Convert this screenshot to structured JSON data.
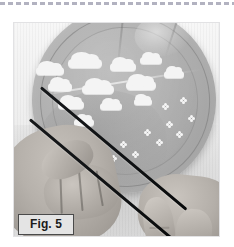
{
  "page": {
    "background_color": "#ffffff",
    "width": 234,
    "height": 247
  },
  "top_rule": {
    "style": "dashed",
    "color": "#b2b2c0",
    "dash_length_px": 5,
    "gap_length_px": 3
  },
  "figure": {
    "label": "Fig. 5",
    "label_background": "#e4e4e4",
    "label_border_color": "#4a4a4a",
    "label_text_color": "#1b1b1b",
    "frame_border_color": "#e2e2e4",
    "photo": {
      "type": "grayscale-photograph",
      "subject": "Two hands holding a decorated paper plate with two dark sticks laid diagonally across it",
      "plate_color": "#b0b0b0",
      "decoration_color": "#f4f4f4",
      "stick_color": "#101214",
      "skin_color": "#b4afa9",
      "backdrop_color": "#f1f1f1"
    }
  },
  "decorations": {
    "clouds": [
      {
        "left": 22,
        "top": 44,
        "width": 28,
        "height": 8
      },
      {
        "left": 54,
        "top": 36,
        "width": 34,
        "height": 9
      },
      {
        "left": 96,
        "top": 40,
        "width": 26,
        "height": 8
      },
      {
        "left": 126,
        "top": 34,
        "width": 22,
        "height": 7
      },
      {
        "left": 34,
        "top": 60,
        "width": 24,
        "height": 8
      },
      {
        "left": 68,
        "top": 62,
        "width": 32,
        "height": 9
      },
      {
        "left": 112,
        "top": 58,
        "width": 30,
        "height": 9
      },
      {
        "left": 150,
        "top": 48,
        "width": 20,
        "height": 7
      },
      {
        "left": 44,
        "top": 78,
        "width": 26,
        "height": 8
      },
      {
        "left": 86,
        "top": 80,
        "width": 22,
        "height": 7
      },
      {
        "left": 120,
        "top": 76,
        "width": 18,
        "height": 6
      },
      {
        "left": 60,
        "top": 96,
        "width": 20,
        "height": 7
      }
    ],
    "flowers": [
      {
        "left": 40,
        "top": 132
      },
      {
        "left": 52,
        "top": 142
      },
      {
        "left": 62,
        "top": 126
      },
      {
        "left": 74,
        "top": 138
      },
      {
        "left": 86,
        "top": 120
      },
      {
        "left": 96,
        "top": 132
      },
      {
        "left": 106,
        "top": 118
      },
      {
        "left": 118,
        "top": 128
      },
      {
        "left": 130,
        "top": 106
      },
      {
        "left": 142,
        "top": 116
      },
      {
        "left": 152,
        "top": 98
      },
      {
        "left": 162,
        "top": 108
      },
      {
        "left": 174,
        "top": 92
      },
      {
        "left": 148,
        "top": 80
      },
      {
        "left": 166,
        "top": 74
      }
    ]
  }
}
